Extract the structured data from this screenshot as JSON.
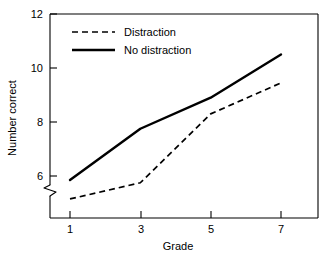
{
  "chart_data": {
    "type": "line",
    "title": "",
    "xlabel": "Grade",
    "ylabel": "Number correct",
    "x": [
      1,
      3,
      5,
      7
    ],
    "xticklabels": [
      "1",
      "3",
      "5",
      "7"
    ],
    "yticklabels": [
      "6",
      "8",
      "10",
      "12"
    ],
    "yticks": [
      6,
      8,
      10,
      12
    ],
    "ylim": [
      4.7,
      12
    ],
    "xlim": [
      0.45,
      7.85
    ],
    "y_axis_break": true,
    "y_axis_break_note": "axis break (zigzag) on y-axis just below the 6 tick",
    "grid": false,
    "legend_position": "upper left inside plot",
    "series": [
      {
        "name": "Distraction",
        "style": "dashed",
        "color": "#000000",
        "values": [
          5.15,
          5.75,
          8.3,
          9.45
        ]
      },
      {
        "name": "No distraction",
        "style": "solid",
        "color": "#000000",
        "values": [
          5.85,
          7.75,
          8.9,
          10.5
        ]
      }
    ]
  },
  "legend": {
    "items": [
      {
        "label": "Distraction",
        "style": "dashed"
      },
      {
        "label": "No distraction",
        "style": "solid"
      }
    ]
  },
  "axes": {
    "x_title": "Grade",
    "y_title": "Number correct",
    "x_tick_labels": [
      "1",
      "3",
      "5",
      "7"
    ],
    "y_tick_labels": [
      "12",
      "10",
      "8",
      "6"
    ]
  },
  "colors": {
    "ink": "#000000",
    "background": "#ffffff"
  }
}
